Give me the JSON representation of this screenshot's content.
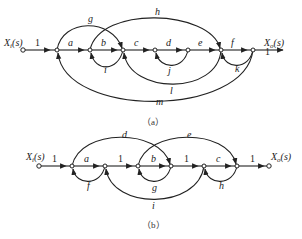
{
  "diagram_a": {
    "caption": "（a）",
    "input_label": "X",
    "input_sub": "i",
    "input_arg": "(s)",
    "output_label": "X",
    "output_sub": "o",
    "output_arg": "(s)",
    "forward_gains": [
      "1",
      "a",
      "b",
      "c",
      "d",
      "e",
      "f",
      "1"
    ],
    "feedforward": {
      "g": "g",
      "h": "h"
    },
    "feedback": {
      "i": "i",
      "j": "j",
      "k": "k",
      "l": "l",
      "m": "m"
    }
  },
  "diagram_b": {
    "caption": "（b）",
    "input_label": "X",
    "input_sub": "i",
    "input_arg": "(s)",
    "output_label": "X",
    "output_sub": "o",
    "output_arg": "(s)",
    "forward_gains": [
      "1",
      "a",
      "1",
      "b",
      "1",
      "c",
      "1"
    ],
    "feedforward": {
      "d": "d",
      "e": "e"
    },
    "feedback": {
      "f": "f",
      "g": "g",
      "h": "h",
      "i": "i"
    }
  }
}
